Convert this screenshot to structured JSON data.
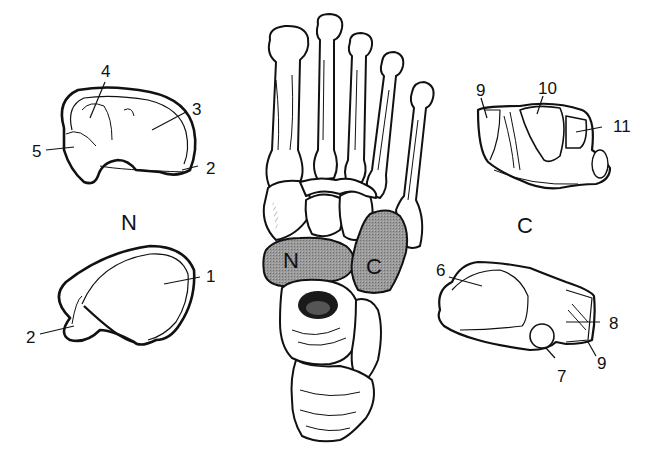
{
  "figure": {
    "highlight_color": "#8a8a8a",
    "line_color": "#111111",
    "background": "#ffffff"
  },
  "center": {
    "navicular_tag": "N",
    "cuboid_tag": "C"
  },
  "navicular": {
    "caption": "N",
    "upper_view": {
      "labels": [
        {
          "id": "4",
          "text": "4"
        },
        {
          "id": "3",
          "text": "3"
        },
        {
          "id": "5",
          "text": "5"
        },
        {
          "id": "2",
          "text": "2"
        }
      ]
    },
    "lower_view": {
      "labels": [
        {
          "id": "1",
          "text": "1"
        },
        {
          "id": "2",
          "text": "2"
        }
      ]
    }
  },
  "cuboid": {
    "caption": "C",
    "upper_view": {
      "labels": [
        {
          "id": "9",
          "text": "9"
        },
        {
          "id": "10",
          "text": "10"
        },
        {
          "id": "11",
          "text": "11"
        }
      ]
    },
    "lower_view": {
      "labels": [
        {
          "id": "6",
          "text": "6"
        },
        {
          "id": "8",
          "text": "8"
        },
        {
          "id": "7",
          "text": "7"
        },
        {
          "id": "9",
          "text": "9"
        }
      ]
    }
  }
}
